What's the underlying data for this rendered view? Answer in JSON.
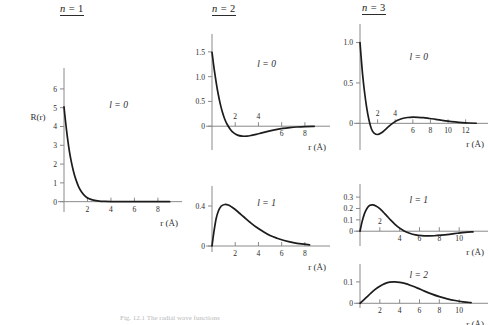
{
  "figure": {
    "caption": "Fig. 12.1   The radial wave functions",
    "columns": [
      {
        "id": "n1",
        "prefix": "n",
        "eq": " = ",
        "value": "1"
      },
      {
        "id": "n2",
        "prefix": "n",
        "eq": " = ",
        "value": "2"
      },
      {
        "id": "n3",
        "prefix": "n",
        "eq": " = ",
        "value": "3"
      }
    ],
    "y_axis_label": "R(r)",
    "x_axis_label": "r (Å)"
  },
  "chart_data": [
    {
      "id": "n1-l0",
      "type": "line",
      "title": "n = 1, l = 0",
      "orbital_label": "l = 0",
      "n": 1,
      "l": 0,
      "xlabel": "r (Å)",
      "ylabel": "R(r)",
      "xlim": [
        0,
        9.2
      ],
      "ylim": [
        -0.55,
        6.9
      ],
      "xticks": [
        2,
        4,
        6,
        8
      ],
      "xticks_above": [],
      "yticks": [
        0,
        1,
        2,
        3,
        4,
        5,
        6
      ],
      "ytick_labels": [
        "0",
        "1",
        "2",
        "3",
        "4",
        "5",
        "6"
      ],
      "grid": false,
      "x": [
        0.0,
        0.08,
        0.18,
        0.3,
        0.45,
        0.6,
        0.8,
        1.0,
        1.25,
        1.5,
        1.8,
        2.1,
        2.5,
        3.0,
        3.5,
        4.0,
        5.0,
        6.0,
        7.0,
        8.0,
        9.0
      ],
      "y": [
        5.05,
        4.55,
        4.0,
        3.38,
        2.72,
        2.2,
        1.63,
        1.2,
        0.79,
        0.52,
        0.3,
        0.17,
        0.082,
        0.03,
        0.012,
        0.005,
        0.001,
        0.0,
        0.0,
        0.0,
        0.0
      ]
    },
    {
      "id": "n2-l0",
      "type": "line",
      "title": "n = 2, l = 0",
      "orbital_label": "l = 0",
      "n": 2,
      "l": 0,
      "xlabel": "r (Å)",
      "ylabel": "",
      "xlim": [
        0,
        9.3
      ],
      "ylim": [
        -0.48,
        1.78
      ],
      "xticks": [
        6,
        8
      ],
      "xticks_above": [
        2,
        4
      ],
      "yticks": [
        0,
        0.5,
        1.0,
        1.5
      ],
      "ytick_labels": [
        "0",
        "0.5",
        "1.0",
        "1.5"
      ],
      "grid": false,
      "x": [
        0.0,
        0.1,
        0.2,
        0.35,
        0.5,
        0.7,
        0.9,
        1.1,
        1.3,
        1.6,
        1.9,
        2.2,
        2.6,
        3.0,
        3.4,
        3.8,
        4.3,
        4.9,
        5.5,
        6.1,
        6.7,
        7.3,
        8.0,
        8.8
      ],
      "y": [
        1.49,
        1.31,
        1.13,
        0.9,
        0.69,
        0.46,
        0.28,
        0.14,
        0.04,
        -0.07,
        -0.14,
        -0.18,
        -0.2,
        -0.2,
        -0.185,
        -0.165,
        -0.135,
        -0.1,
        -0.07,
        -0.045,
        -0.028,
        -0.016,
        -0.007,
        -0.002
      ]
    },
    {
      "id": "n2-l1",
      "type": "line",
      "title": "n = 2, l = 1",
      "orbital_label": "l = 1",
      "n": 2,
      "l": 1,
      "xlabel": "r (Å)",
      "ylabel": "",
      "xlim": [
        0,
        9.3
      ],
      "ylim": [
        -0.06,
        0.56
      ],
      "xticks": [
        2,
        4,
        6,
        8
      ],
      "xticks_above": [],
      "yticks": [
        0,
        0.4
      ],
      "ytick_labels": [
        "0",
        "0.4"
      ],
      "grid": false,
      "x": [
        0.0,
        0.15,
        0.35,
        0.55,
        0.8,
        1.1,
        1.4,
        1.7,
        2.0,
        2.4,
        2.8,
        3.3,
        3.8,
        4.4,
        5.0,
        5.6,
        6.3,
        7.0,
        7.7,
        8.4
      ],
      "y": [
        0.0,
        0.13,
        0.27,
        0.35,
        0.4,
        0.415,
        0.41,
        0.39,
        0.365,
        0.325,
        0.285,
        0.235,
        0.19,
        0.145,
        0.105,
        0.078,
        0.052,
        0.034,
        0.021,
        0.012
      ]
    },
    {
      "id": "n3-l0",
      "type": "line",
      "title": "n = 3, l = 0",
      "orbital_label": "l = 0",
      "n": 3,
      "l": 0,
      "xlabel": "r (Å)",
      "ylabel": "",
      "xlim": [
        0,
        13.4
      ],
      "ylim": [
        -0.33,
        1.18
      ],
      "xticks": [
        6,
        8,
        10,
        12
      ],
      "xticks_above": [
        2,
        4
      ],
      "yticks": [
        0,
        0.5,
        1.0
      ],
      "ytick_labels": [
        "0",
        "0.5",
        "1.0"
      ],
      "grid": false,
      "x": [
        0.0,
        0.12,
        0.3,
        0.5,
        0.75,
        1.0,
        1.3,
        1.6,
        2.0,
        2.4,
        2.8,
        3.2,
        3.7,
        4.2,
        4.8,
        5.4,
        6.0,
        6.6,
        7.2,
        7.9,
        8.6,
        9.3,
        10.0,
        10.8,
        11.6,
        12.4,
        13.2
      ],
      "y": [
        1.0,
        0.83,
        0.6,
        0.4,
        0.2,
        0.05,
        -0.07,
        -0.12,
        -0.138,
        -0.12,
        -0.085,
        -0.045,
        0.0,
        0.035,
        0.06,
        0.072,
        0.077,
        0.075,
        0.07,
        0.06,
        0.05,
        0.038,
        0.027,
        0.017,
        0.009,
        0.004,
        0.001
      ]
    },
    {
      "id": "n3-l1",
      "type": "line",
      "title": "n = 3, l = 1",
      "orbital_label": "l = 1",
      "n": 3,
      "l": 1,
      "xlabel": "r (Å)",
      "ylabel": "",
      "xlim": [
        0,
        11.9
      ],
      "ylim": [
        -0.13,
        0.38
      ],
      "xticks": [
        4,
        6,
        8,
        10
      ],
      "xticks_above": [
        2
      ],
      "yticks": [
        0,
        0.1,
        0.2,
        0.3
      ],
      "ytick_labels": [
        "0",
        "0.1",
        "0.2",
        "0.3"
      ],
      "grid": false,
      "x": [
        0.0,
        0.2,
        0.45,
        0.7,
        1.0,
        1.3,
        1.6,
        1.9,
        2.3,
        2.7,
        3.1,
        3.5,
        4.0,
        4.5,
        5.0,
        5.6,
        6.2,
        6.8,
        7.5,
        8.2,
        9.0,
        9.8,
        10.6,
        11.4
      ],
      "y": [
        0.0,
        0.08,
        0.155,
        0.2,
        0.228,
        0.232,
        0.222,
        0.205,
        0.172,
        0.135,
        0.098,
        0.063,
        0.027,
        0.0,
        -0.018,
        -0.032,
        -0.039,
        -0.041,
        -0.04,
        -0.035,
        -0.027,
        -0.018,
        -0.01,
        -0.005
      ]
    },
    {
      "id": "n3-l2",
      "type": "line",
      "title": "n = 3, l = 2",
      "orbital_label": "l = 2",
      "n": 3,
      "l": 2,
      "xlabel": "r (Å)",
      "ylabel": "",
      "xlim": [
        0,
        11.9
      ],
      "ylim": [
        -0.022,
        0.165
      ],
      "xticks": [
        2,
        4,
        6,
        8,
        10
      ],
      "xticks_above": [],
      "yticks": [
        0,
        0.1
      ],
      "ytick_labels": [
        "0",
        "0.1"
      ],
      "grid": false,
      "x": [
        0.0,
        0.3,
        0.7,
        1.1,
        1.5,
        2.0,
        2.5,
        3.0,
        3.5,
        4.0,
        4.6,
        5.2,
        5.8,
        6.5,
        7.2,
        8.0,
        8.8,
        9.6,
        10.4,
        11.2
      ],
      "y": [
        0.0,
        0.012,
        0.03,
        0.048,
        0.064,
        0.08,
        0.092,
        0.099,
        0.1,
        0.098,
        0.092,
        0.082,
        0.071,
        0.057,
        0.044,
        0.031,
        0.021,
        0.013,
        0.007,
        0.003
      ]
    }
  ],
  "panels": [
    {
      "id": "n1-l0",
      "left": 18,
      "top": 62,
      "w": 160,
      "h": 172,
      "plotx": 46,
      "ploty": 10,
      "plotw": 108,
      "ploth": 140,
      "ylab": true
    },
    {
      "id": "n2-l0",
      "left": 168,
      "top": 28,
      "w": 162,
      "h": 142,
      "plotx": 44,
      "ploty": 10,
      "plotw": 108,
      "ploth": 112,
      "ylab": false
    },
    {
      "id": "n2-l1",
      "left": 168,
      "top": 182,
      "w": 162,
      "h": 92,
      "plotx": 44,
      "ploty": 8,
      "plotw": 108,
      "ploth": 62,
      "ylab": false
    },
    {
      "id": "n3-l0",
      "left": 318,
      "top": 18,
      "w": 172,
      "h": 152,
      "plotx": 42,
      "ploty": 10,
      "plotw": 118,
      "ploth": 122,
      "ylab": false
    },
    {
      "id": "n3-l1",
      "left": 318,
      "top": 180,
      "w": 172,
      "h": 88,
      "plotx": 42,
      "ploty": 8,
      "plotw": 118,
      "ploth": 58,
      "ylab": false
    },
    {
      "id": "n3-l2",
      "left": 318,
      "top": 262,
      "w": 172,
      "h": 62,
      "plotx": 42,
      "ploty": 6,
      "plotw": 118,
      "ploth": 40,
      "ylab": false
    }
  ],
  "titles": [
    {
      "idx": 0,
      "left": 60,
      "top": 3
    },
    {
      "idx": 1,
      "left": 212,
      "top": 3
    },
    {
      "idx": 2,
      "left": 362,
      "top": 2
    }
  ]
}
